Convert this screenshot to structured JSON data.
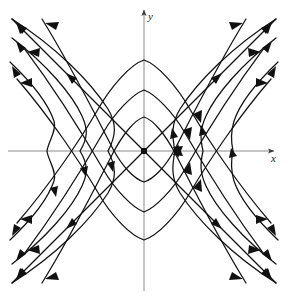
{
  "figure": {
    "kind": "phase-portrait",
    "background_color": "#ffffff",
    "curve_color": "#111111",
    "axis_color": "#8a8a8a",
    "arrow_color": "#111111"
  },
  "axes": {
    "x": {
      "label": "x",
      "label_x": 271,
      "label_y": 153,
      "start_px": 8,
      "end_px": 277,
      "y_px": 151,
      "arrow": "right"
    },
    "y": {
      "label": "y",
      "label_x": 148,
      "label_y": 11,
      "start_px": 291,
      "end_px": 7,
      "x_px": 144,
      "arrow": "up"
    },
    "origin": {
      "x": 144,
      "y": 151,
      "marker": "filled-square-dot"
    }
  },
  "chart_data": {
    "type": "line",
    "title": "",
    "xlabel": "x",
    "ylabel": "y",
    "grid": false,
    "legend": null,
    "xlim": [
      -4.8,
      4.8
    ],
    "ylim": [
      -5.2,
      5.0
    ],
    "equilibrium_points": [
      {
        "x": 0,
        "y": 0,
        "type": "saddle",
        "stability": "unstable"
      }
    ],
    "separatrices": [
      {
        "name": "asymptote-positive-slope",
        "slope": 1.0,
        "flow": "outward"
      },
      {
        "name": "asymptote-negative-slope",
        "slope": -1.0,
        "flow": "outward"
      }
    ],
    "families": [
      {
        "name": "right-opening-hyperbolas",
        "form": "x^2 - y^2 = c, c > 0",
        "vertex_px_x": [
          175,
          203,
          233
        ],
        "flow": "outward",
        "count": 3
      },
      {
        "name": "left-opening-hyperbolas",
        "form": "x^2 - y^2 = c, c > 0",
        "vertex_px_x": [
          108,
          80,
          47
        ],
        "flow": "outward",
        "count": 3
      },
      {
        "name": "up-opening-hyperbolas",
        "form": "y^2 - x^2 = c, c > 0",
        "vertex_px_y": [
          117,
          90,
          60
        ],
        "flow": "outward",
        "count": 3
      },
      {
        "name": "down-opening-hyperbolas",
        "form": "y^2 - x^2 = c, c > 0",
        "vertex_px_y": [
          182,
          212,
          240
        ],
        "flow": "outward",
        "count": 3
      }
    ],
    "arrow_direction": "away from origin along all trajectories"
  }
}
